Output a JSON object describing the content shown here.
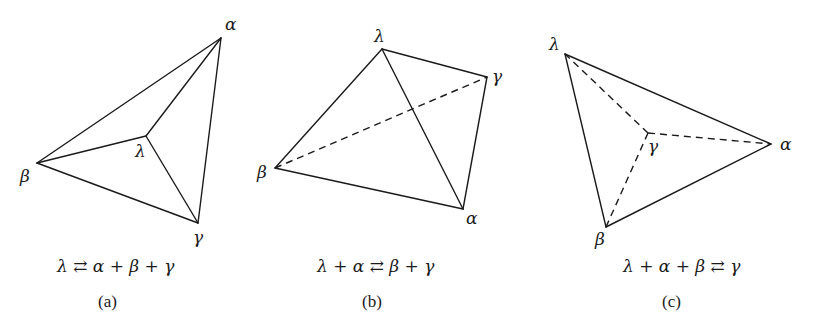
{
  "figure": {
    "panels": [
      {
        "id": "a",
        "caption": "(a)",
        "equation": "λ ⇄ α + β + γ",
        "vertices": {
          "alpha": {
            "label": "α",
            "x": 221,
            "y": 38
          },
          "beta": {
            "label": "β",
            "x": 37,
            "y": 163
          },
          "lambda": {
            "label": "λ",
            "x": 146,
            "y": 136
          },
          "gamma": {
            "label": "γ",
            "x": 198,
            "y": 223
          }
        },
        "solid_edges": [
          [
            "alpha",
            "beta"
          ],
          [
            "alpha",
            "gamma"
          ],
          [
            "beta",
            "gamma"
          ],
          [
            "lambda",
            "alpha"
          ],
          [
            "lambda",
            "beta"
          ],
          [
            "lambda",
            "gamma"
          ]
        ],
        "dashed_edges": []
      },
      {
        "id": "b",
        "caption": "(b)",
        "equation": "λ + α ⇄ β + γ",
        "vertices": {
          "lambda": {
            "label": "λ",
            "x": 382,
            "y": 49
          },
          "gamma": {
            "label": "γ",
            "x": 487,
            "y": 77
          },
          "beta": {
            "label": "β",
            "x": 275,
            "y": 168
          },
          "alpha": {
            "label": "α",
            "x": 463,
            "y": 209
          }
        },
        "solid_edges": [
          [
            "lambda",
            "gamma"
          ],
          [
            "lambda",
            "beta"
          ],
          [
            "lambda",
            "alpha"
          ],
          [
            "gamma",
            "alpha"
          ],
          [
            "beta",
            "alpha"
          ]
        ],
        "dashed_edges": [
          [
            "beta",
            "gamma"
          ]
        ]
      },
      {
        "id": "c",
        "caption": "(c)",
        "equation": "λ + α + β ⇄ γ",
        "vertices": {
          "lambda": {
            "label": "λ",
            "x": 565,
            "y": 54
          },
          "alpha": {
            "label": "α",
            "x": 771,
            "y": 144
          },
          "beta": {
            "label": "β",
            "x": 606,
            "y": 227
          },
          "gamma": {
            "label": "γ",
            "x": 648,
            "y": 133
          }
        },
        "solid_edges": [
          [
            "lambda",
            "alpha"
          ],
          [
            "lambda",
            "beta"
          ],
          [
            "beta",
            "alpha"
          ]
        ],
        "dashed_edges": [
          [
            "gamma",
            "lambda"
          ],
          [
            "gamma",
            "alpha"
          ],
          [
            "gamma",
            "beta"
          ]
        ]
      }
    ]
  },
  "labels": {
    "a": {
      "alpha": "α",
      "beta": "β",
      "lambda": "λ",
      "gamma": "γ",
      "equation": "λ ⇄ α + β + γ",
      "caption": "(a)"
    },
    "b": {
      "alpha": "α",
      "beta": "β",
      "lambda": "λ",
      "gamma": "γ",
      "equation": "λ + α ⇄ β + γ",
      "caption": "(b)"
    },
    "c": {
      "alpha": "α",
      "beta": "β",
      "lambda": "λ",
      "gamma": "γ",
      "equation": "λ + α + β ⇄ γ",
      "caption": "(c)"
    }
  },
  "colors": {
    "ink": "#1a1a1a",
    "background": "#ffffff"
  }
}
